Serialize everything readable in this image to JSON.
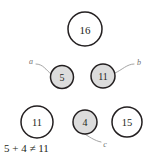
{
  "diagram": {
    "type": "number-circle-diagram",
    "width": 154,
    "height": 158,
    "background_color": "#ffffff",
    "stroke_color": "#231f20",
    "shaded_fill_color": "#dcdcdc",
    "unshaded_fill_color": "#ffffff",
    "pointer_color": "#9a9a9a",
    "label_color": "#6f6f6f",
    "nodes": [
      {
        "id": "node-16",
        "value": "16",
        "cx": 85,
        "cy": 29,
        "r": 17,
        "fill": "white",
        "font_size": 11
      },
      {
        "id": "node-5",
        "value": "5",
        "cx": 62,
        "cy": 77,
        "r": 11.5,
        "fill": "gray",
        "font_size": 10
      },
      {
        "id": "node-11-top",
        "value": "11",
        "cx": 103,
        "cy": 76,
        "r": 12,
        "fill": "gray",
        "font_size": 10
      },
      {
        "id": "node-11-bottom",
        "value": "11",
        "cx": 37,
        "cy": 122,
        "r": 16,
        "fill": "white",
        "font_size": 10.5
      },
      {
        "id": "node-4",
        "value": "4",
        "cx": 85,
        "cy": 122,
        "r": 12,
        "fill": "gray",
        "font_size": 10
      },
      {
        "id": "node-15",
        "value": "15",
        "cx": 127,
        "cy": 122,
        "r": 15,
        "fill": "white",
        "font_size": 10.5
      }
    ],
    "pointers": [
      {
        "id": "pointer-a",
        "label": "a",
        "label_x": 31,
        "label_y": 61,
        "label_font_size": 8,
        "path": "M 36 64 C 43 64, 46 70, 51 74"
      },
      {
        "id": "pointer-b",
        "label": "b",
        "label_x": 139,
        "label_y": 62,
        "label_font_size": 8,
        "path": "M 134 64 C 127 64, 122 70, 115 73"
      },
      {
        "id": "pointer-c",
        "label": "c",
        "label_x": 105,
        "label_y": 144,
        "label_font_size": 8,
        "path": "M 101 142 C 95 141, 88 136, 83 133"
      }
    ],
    "equation": {
      "text": "5 + 4 ≠ 11",
      "x": 4,
      "y": 148,
      "font_size": 11
    }
  }
}
